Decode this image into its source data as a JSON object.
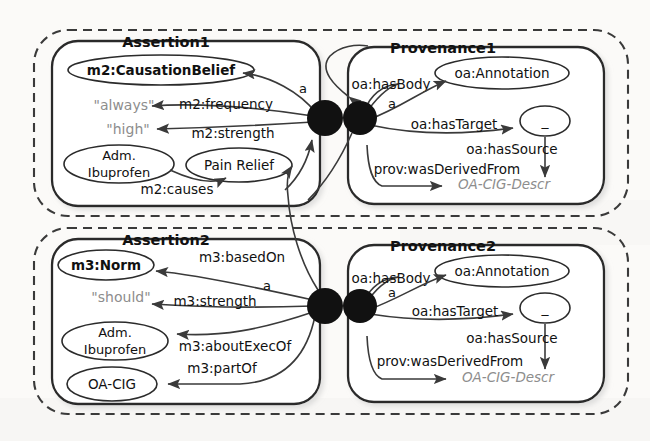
{
  "figure": {
    "background_color": "#fbfaf8",
    "stroke_color": "#2b2b2b",
    "literal_color": "#8d8d8d",
    "blank_node_color": "#111111"
  },
  "containers": [
    {
      "id": "group1",
      "style": "dashed-rounded",
      "boxes": [
        {
          "id": "assertion1",
          "legend": "Assertion1"
        },
        {
          "id": "provenance1",
          "legend": "Provenance1"
        }
      ]
    },
    {
      "id": "group2",
      "style": "dashed-rounded",
      "boxes": [
        {
          "id": "assertion2",
          "legend": "Assertion2"
        },
        {
          "id": "provenance2",
          "legend": "Provenance2"
        }
      ]
    }
  ],
  "assertion1": {
    "legend": "Assertion1",
    "nodes": [
      {
        "name": "class-node",
        "label": "m2:CausationBelief",
        "shape": "ellipse",
        "bold": true
      },
      {
        "name": "literal-always",
        "label": "\"always\"",
        "shape": "literal"
      },
      {
        "name": "literal-high",
        "label": "\"high\"",
        "shape": "literal"
      },
      {
        "name": "node-adm",
        "label": "Adm.",
        "label2": "Ibuprofen",
        "shape": "ellipse"
      },
      {
        "name": "node-pain",
        "label": "Pain Relief",
        "shape": "ellipse"
      }
    ],
    "edges": [
      {
        "name": "edge-a",
        "label": "a"
      },
      {
        "name": "edge-frequency",
        "label": "m2:frequency"
      },
      {
        "name": "edge-strength",
        "label": "m2:strength"
      },
      {
        "name": "edge-causes",
        "label": "m2:causes"
      }
    ]
  },
  "provenance1": {
    "legend": "Provenance1",
    "nodes": [
      {
        "name": "annotation-node",
        "label": "oa:Annotation",
        "shape": "ellipse"
      },
      {
        "name": "blank-node",
        "label": "_",
        "shape": "ellipse"
      },
      {
        "name": "descr-node",
        "label": "OA-CIG-Descr",
        "shape": "literal-italic"
      }
    ],
    "edges": [
      {
        "name": "edge-hasbody",
        "label": "oa:hasBody"
      },
      {
        "name": "edge-a",
        "label": "a"
      },
      {
        "name": "edge-hastarget",
        "label": "oa:hasTarget"
      },
      {
        "name": "edge-hassource",
        "label": "oa:hasSource"
      },
      {
        "name": "edge-wasderivedfrom",
        "label": "prov:wasDerivedFrom"
      }
    ]
  },
  "assertion2": {
    "legend": "Assertion2",
    "nodes": [
      {
        "name": "class-node",
        "label": "m3:Norm",
        "shape": "ellipse",
        "bold": true
      },
      {
        "name": "literal-should",
        "label": "\"should\"",
        "shape": "literal"
      },
      {
        "name": "node-adm",
        "label": "Adm.",
        "label2": "Ibuprofen",
        "shape": "ellipse"
      },
      {
        "name": "node-oacig",
        "label": "OA-CIG",
        "shape": "ellipse"
      }
    ],
    "edges": [
      {
        "name": "edge-basedon",
        "label": "m3:basedOn"
      },
      {
        "name": "edge-a",
        "label": "a"
      },
      {
        "name": "edge-strength",
        "label": "m3:strength"
      },
      {
        "name": "edge-aboutexecof",
        "label": "m3:aboutExecOf"
      },
      {
        "name": "edge-partof",
        "label": "m3:partOf"
      }
    ]
  },
  "provenance2": {
    "legend": "Provenance2",
    "nodes": [
      {
        "name": "annotation-node",
        "label": "oa:Annotation",
        "shape": "ellipse"
      },
      {
        "name": "blank-node",
        "label": "_",
        "shape": "ellipse"
      },
      {
        "name": "descr-node",
        "label": "OA-CIG-Descr",
        "shape": "literal-italic"
      }
    ],
    "edges": [
      {
        "name": "edge-hasbody",
        "label": "oa:hasBody"
      },
      {
        "name": "edge-a",
        "label": "a"
      },
      {
        "name": "edge-hastarget",
        "label": "oa:hasTarget"
      },
      {
        "name": "edge-hassource",
        "label": "oa:hasSource"
      },
      {
        "name": "edge-wasderivedfrom",
        "label": "prov:wasDerivedFrom"
      }
    ]
  }
}
